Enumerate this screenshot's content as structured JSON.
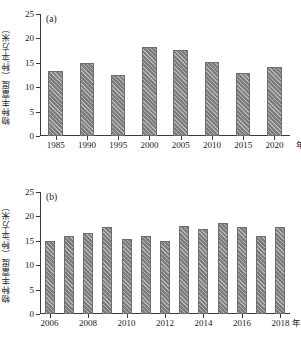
{
  "figure": {
    "ylabel": "物种丰富度（种/平方米）",
    "xlabel": "年份",
    "bar_color": "#7d7d7d",
    "bar_edge_color": "#6e6e6e",
    "axis_color": "#3b3b3b"
  },
  "panel_a": {
    "tag": "(a)",
    "yticks": [
      "0",
      "5",
      "10",
      "15",
      "20",
      "25"
    ],
    "xticks": [
      "1985",
      "1990",
      "1995",
      "2000",
      "2005",
      "2010",
      "2015",
      "2020"
    ]
  },
  "panel_b": {
    "tag": "(b)",
    "yticks": [
      "0",
      "5",
      "10",
      "15",
      "20",
      "25"
    ],
    "xticks": [
      "2006",
      "2008",
      "2010",
      "2012",
      "2014",
      "2016",
      "2018"
    ]
  },
  "chart_data": [
    {
      "type": "bar",
      "panel": "(a)",
      "title": "",
      "xlabel": "年份",
      "ylabel": "物种丰富度（种/平方米）",
      "categories": [
        "1985",
        "1990",
        "1995",
        "2000",
        "2005",
        "2010",
        "2015",
        "2020"
      ],
      "values": [
        13.4,
        14.9,
        12.5,
        18.3,
        17.6,
        15.1,
        13.0,
        14.2
      ],
      "ylim": [
        0,
        25
      ],
      "ytick_values": [
        0,
        5,
        10,
        15,
        20,
        25
      ],
      "grid": false,
      "legend": false
    },
    {
      "type": "bar",
      "panel": "(b)",
      "title": "",
      "xlabel": "年份",
      "ylabel": "物种丰富度（种/平方米）",
      "categories": [
        "2006",
        "2007",
        "2008",
        "2009",
        "2010",
        "2011",
        "2012",
        "2013",
        "2014",
        "2015",
        "2016",
        "2017",
        "2018"
      ],
      "values": [
        14.9,
        16.0,
        16.5,
        17.9,
        15.4,
        16.0,
        14.9,
        18.0,
        17.5,
        18.6,
        17.8,
        15.9,
        17.8
      ],
      "ylim": [
        0,
        25
      ],
      "ytick_values": [
        0,
        5,
        10,
        15,
        20,
        25
      ],
      "xtick_labels": [
        "2006",
        "2008",
        "2010",
        "2012",
        "2014",
        "2016",
        "2018"
      ],
      "grid": false,
      "legend": false
    }
  ]
}
